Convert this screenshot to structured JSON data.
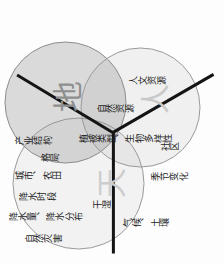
{
  "diagram": {
    "type": "venn-three-circle",
    "orientation_note": "图像旋转90度",
    "circles": [
      {
        "key": "tian",
        "big_char": "天",
        "fill": "#f2f2f2",
        "stroke": "#9a9a9a"
      },
      {
        "key": "di",
        "big_char": "地",
        "fill": "#c8c8c8",
        "stroke": "#8d8d8d"
      },
      {
        "key": "ren",
        "big_char": "人",
        "fill": "#ededed",
        "stroke": "#9a9a9a"
      }
    ],
    "labels": {
      "natural_disaster": "自然灾害",
      "precipitation_amount_distribution": "降水量、降水分布",
      "precipitation_period": "降水时段",
      "city_farmland": "城市、农田",
      "pattern": "格局",
      "industrial_structure": "产业结构",
      "vegetation_biodiversity": "植被类型、生物多样性",
      "climate_soil": "气候、土壤",
      "dry_wet": "干湿",
      "seasonal_change": "季节变化",
      "community": "社区",
      "natural_resources": "自然资源",
      "cultural_resources": "人文资源"
    }
  }
}
